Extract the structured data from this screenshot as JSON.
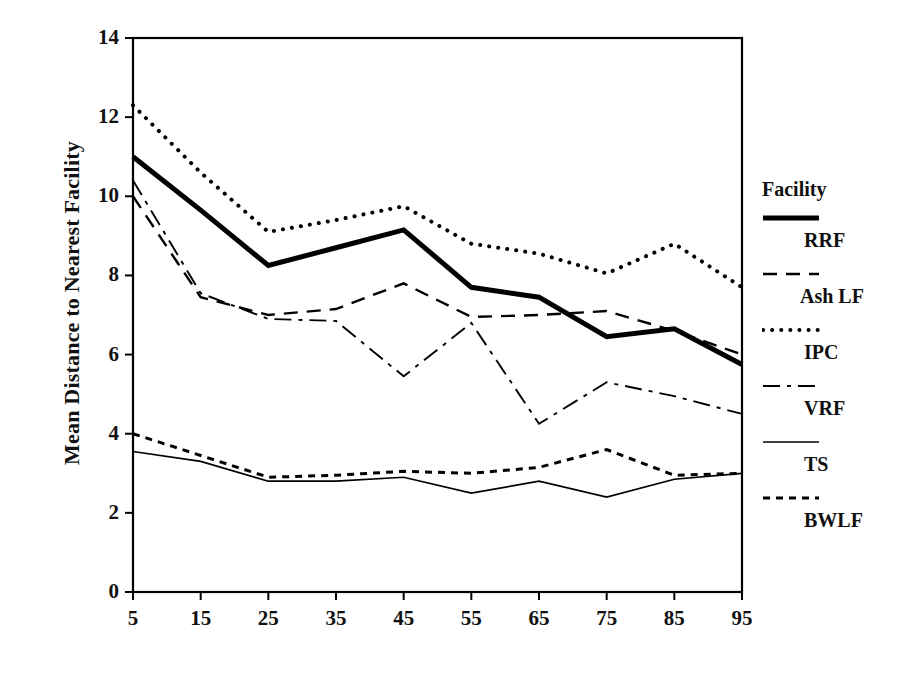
{
  "figure": {
    "ylabel": "Mean Distance to Nearest Facility",
    "xlabel": ""
  },
  "axes": {
    "yticks": [
      "0",
      "2",
      "4",
      "6",
      "8",
      "10",
      "12",
      "14"
    ],
    "xticks": [
      "5",
      "15",
      "25",
      "35",
      "45",
      "55",
      "65",
      "75",
      "85",
      "95"
    ]
  },
  "legend": {
    "title": "Facility",
    "entries": [
      {
        "label": "RRF",
        "style": "thick-solid"
      },
      {
        "label": "Ash LF",
        "style": "dashed"
      },
      {
        "label": "IPC",
        "style": "dotted"
      },
      {
        "label": "VRF",
        "style": "dash-dot"
      },
      {
        "label": "TS",
        "style": "thin-solid"
      },
      {
        "label": "BWLF",
        "style": "short-dash"
      }
    ]
  },
  "chart_data": {
    "type": "line",
    "title": "",
    "xlabel": "",
    "ylabel": "Mean Distance to Nearest Facility",
    "x": [
      5,
      15,
      25,
      35,
      45,
      55,
      65,
      75,
      85,
      95
    ],
    "xlim": [
      5,
      95
    ],
    "ylim": [
      0,
      14
    ],
    "grid": false,
    "legend_position": "right",
    "legend_title": "Facility",
    "series": [
      {
        "name": "RRF",
        "style": "thick-solid",
        "color": "#000000",
        "values": [
          11.0,
          9.65,
          8.25,
          8.7,
          9.15,
          7.7,
          7.45,
          6.45,
          6.65,
          5.75
        ]
      },
      {
        "name": "Ash LF",
        "style": "dashed",
        "color": "#000000",
        "values": [
          10.0,
          7.45,
          7.0,
          7.15,
          7.8,
          6.95,
          7.0,
          7.1,
          6.6,
          6.0
        ]
      },
      {
        "name": "IPC",
        "style": "dotted",
        "color": "#000000",
        "values": [
          12.3,
          10.6,
          9.1,
          9.4,
          9.75,
          8.8,
          8.55,
          8.05,
          8.8,
          7.7
        ]
      },
      {
        "name": "VRF",
        "style": "dash-dot",
        "color": "#000000",
        "values": [
          10.4,
          7.55,
          6.9,
          6.85,
          5.45,
          6.8,
          4.25,
          5.3,
          4.95,
          4.5
        ]
      },
      {
        "name": "TS",
        "style": "thin-solid",
        "color": "#000000",
        "values": [
          3.55,
          3.3,
          2.8,
          2.8,
          2.9,
          2.5,
          2.8,
          2.4,
          2.85,
          3.0
        ]
      },
      {
        "name": "BWLF",
        "style": "short-dash",
        "color": "#000000",
        "values": [
          4.0,
          3.45,
          2.9,
          2.95,
          3.05,
          3.0,
          3.15,
          3.6,
          2.95,
          3.0
        ]
      }
    ]
  },
  "colors": {
    "ink": "#000000",
    "background": "#ffffff"
  }
}
